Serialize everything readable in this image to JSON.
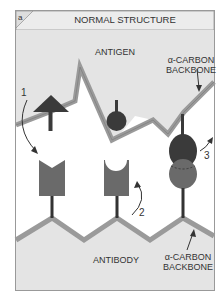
{
  "panel": {
    "letter": "a",
    "title": "NORMAL STRUCTURE"
  },
  "labels": {
    "antigen": "ANTIGEN",
    "antibody": "ANTIBODY",
    "backbone_top_line1": "α-CARBON",
    "backbone_top_line2": "BACKBONE",
    "backbone_bottom_line1": "α-CARBON",
    "backbone_bottom_line2": "BACKBONE",
    "step1": "1",
    "step2": "2",
    "step3": "3"
  },
  "colors": {
    "panel_fill": "#e4e4e4",
    "backbone": "#9a9a9a",
    "dark_shape": "#3a3a3a",
    "mid_shape": "#666666",
    "border": "#888888"
  }
}
